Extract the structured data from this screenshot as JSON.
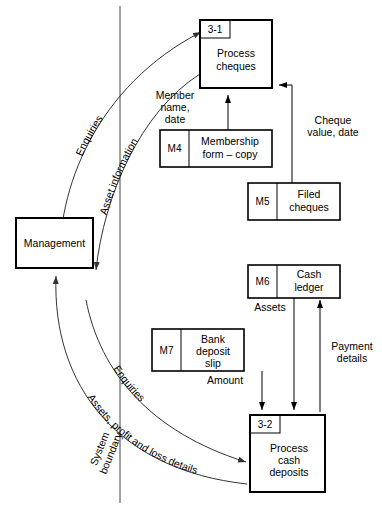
{
  "diagram": {
    "type": "data-flow-diagram",
    "title": "",
    "boundary_label": "System boundary"
  },
  "external_entities": [
    {
      "id": "management",
      "label": "Management"
    }
  ],
  "processes": [
    {
      "id": "p31",
      "number": "3-1",
      "name_line1": "Process",
      "name_line2": "cheques"
    },
    {
      "id": "p32",
      "number": "3-2",
      "name_line1": "Process",
      "name_line2": "cash",
      "name_line3": "deposits"
    }
  ],
  "data_stores": [
    {
      "id": "M4",
      "code": "M4",
      "name_line1": "Membership",
      "name_line2": "form – copy"
    },
    {
      "id": "M5",
      "code": "M5",
      "name_line1": "Filed",
      "name_line2": "cheques"
    },
    {
      "id": "M6",
      "code": "M6",
      "name_line1": "Cash",
      "name_line2": "ledger"
    },
    {
      "id": "M7",
      "code": "M7",
      "name_line1": "Bank",
      "name_line2": "deposit",
      "name_line3": "slip"
    }
  ],
  "flow_labels": {
    "enquiries_top": "Enquiries",
    "asset_information": "Asset  information",
    "member_name_date_1": "Member",
    "member_name_date_2": "name,",
    "member_name_date_3": "date",
    "cheque_value_1": "Cheque",
    "cheque_value_2": "value, date",
    "assets": "Assets",
    "amount": "Amount",
    "payment_details_1": "Payment",
    "payment_details_2": "details",
    "enquiries_bottom": "Enquiries",
    "assets_profit_loss": "Assets, profit and loss details",
    "system_boundary_1": "System",
    "system_boundary_2": "boundary"
  },
  "colors": {
    "stroke": "#000000",
    "curve_stroke": "#333333",
    "background": "#ffffff"
  }
}
